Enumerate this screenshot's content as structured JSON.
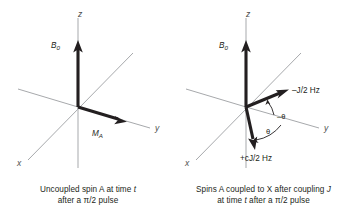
{
  "figure": {
    "background_color": "#ffffff",
    "axis_color": "#a7a9ac",
    "vector_color": "#231f20",
    "text_color": "#231f20"
  },
  "panels": [
    {
      "id": "left",
      "axes": {
        "x": "x",
        "y": "y",
        "z": "z"
      },
      "vectors": [
        {
          "name": "b0",
          "label": "B",
          "sub": "0"
        },
        {
          "name": "ma",
          "label": "M",
          "sub": "A"
        }
      ],
      "caption": {
        "line1_a": "Uncoupled spin A at time ",
        "line1_italic": "t",
        "line1_b": "",
        "line2": "after a π/2 pulse"
      }
    },
    {
      "id": "right",
      "axes": {
        "x": "x",
        "y": "y",
        "z": "z"
      },
      "vectors": [
        {
          "name": "b0",
          "label": "B",
          "sub": "0"
        },
        {
          "name": "upper",
          "label": "–J/2 Hz"
        },
        {
          "name": "lower",
          "label": "+cJ/2 Hz"
        }
      ],
      "angles": [
        {
          "name": "minus-theta",
          "label": "–θ"
        },
        {
          "name": "theta",
          "label": "θ"
        }
      ],
      "caption": {
        "line1_a": "Spins A coupled to X after coupling ",
        "line1_italic": "J",
        "line1_b": "",
        "line2_a": "at time ",
        "line2_italic": "t",
        "line2_b": " after a π/2 pulse"
      }
    }
  ]
}
